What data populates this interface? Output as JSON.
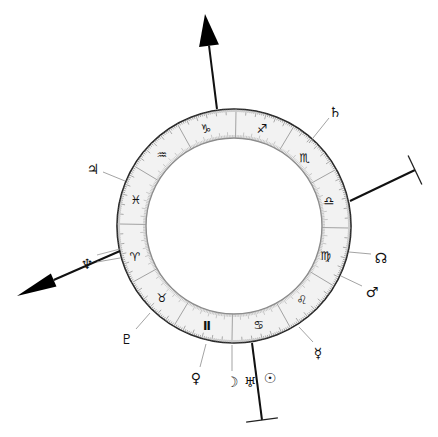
{
  "chart": {
    "center": [
      234,
      226
    ],
    "outer_radius": 117,
    "inner_radius": 88,
    "ring_color": "#f2f2f2",
    "line_color": "#222222",
    "tick_color": "#777777"
  },
  "signs": [
    {
      "name": "Aries",
      "glyph": "♈",
      "x": 135,
      "y": 257
    },
    {
      "name": "Taurus",
      "glyph": "♉",
      "x": 162,
      "y": 298
    },
    {
      "name": "Gemini",
      "glyph": "Ⅱ",
      "x": 207,
      "y": 326
    },
    {
      "name": "Cancer",
      "glyph": "♋",
      "x": 259,
      "y": 325
    },
    {
      "name": "Leo",
      "glyph": "♌",
      "x": 302,
      "y": 300
    },
    {
      "name": "Virgo",
      "glyph": "♍",
      "x": 326,
      "y": 256
    },
    {
      "name": "Libra",
      "glyph": "♎",
      "x": 329,
      "y": 201
    },
    {
      "name": "Scorpio",
      "glyph": "♏",
      "x": 305,
      "y": 158
    },
    {
      "name": "Sagittarius",
      "glyph": "♐",
      "x": 262,
      "y": 129
    },
    {
      "name": "Capricorn",
      "glyph": "♑",
      "x": 206,
      "y": 129
    },
    {
      "name": "Aquarius",
      "glyph": "♒",
      "x": 162,
      "y": 155
    },
    {
      "name": "Pisces",
      "glyph": "♓",
      "x": 136,
      "y": 200
    }
  ],
  "planets": [
    {
      "name": "Saturn",
      "glyph": "♄",
      "x": 335,
      "y": 112,
      "line": [
        [
          309,
          143
        ],
        [
          329,
          118
        ]
      ]
    },
    {
      "name": "Jupiter",
      "glyph": "♃",
      "x": 93,
      "y": 169,
      "line": [
        [
          103,
          172
        ],
        [
          125,
          181
        ]
      ]
    },
    {
      "name": "Neptune",
      "glyph": "♆",
      "x": 87,
      "y": 264,
      "line": [
        [
          97,
          262
        ],
        [
          120,
          258
        ]
      ]
    },
    {
      "name": "Pluto",
      "glyph": "♇",
      "x": 127,
      "y": 339,
      "line": [
        [
          136,
          329
        ],
        [
          150,
          313
        ]
      ]
    },
    {
      "name": "Venus",
      "glyph": "♀",
      "x": 196,
      "y": 378,
      "line": [
        [
          200,
          367
        ],
        [
          206,
          344
        ]
      ]
    },
    {
      "name": "Moon",
      "glyph": "☽",
      "x": 232,
      "y": 382,
      "line": [
        [
          232,
          371
        ],
        [
          232,
          345
        ]
      ]
    },
    {
      "name": "Uranus",
      "glyph": "♅",
      "x": 250,
      "y": 382,
      "line": null
    },
    {
      "name": "Sun",
      "glyph": "☉",
      "x": 270,
      "y": 378,
      "line": null
    },
    {
      "name": "Mercury",
      "glyph": "☿",
      "x": 318,
      "y": 353,
      "line": [
        [
          313,
          342
        ],
        [
          299,
          327
        ]
      ]
    },
    {
      "name": "Mars",
      "glyph": "♂",
      "x": 372,
      "y": 292,
      "line": [
        [
          362,
          286
        ],
        [
          341,
          276
        ]
      ]
    },
    {
      "name": "North Node",
      "glyph": "☊",
      "x": 381,
      "y": 258,
      "line": [
        [
          371,
          254
        ],
        [
          349,
          252
        ]
      ]
    }
  ],
  "axes": [
    {
      "name": "MC",
      "type": "arrow",
      "from": [
        217,
        109
      ],
      "to": [
        205,
        14
      ]
    },
    {
      "name": "ASC",
      "type": "arrow",
      "from": [
        120,
        251
      ],
      "to": [
        17,
        296
      ]
    },
    {
      "name": "DSC",
      "type": "bar",
      "from": [
        350,
        201
      ],
      "to": [
        415,
        170
      ]
    },
    {
      "name": "IC",
      "type": "bar",
      "from": [
        252,
        343
      ],
      "to": [
        262,
        420
      ]
    }
  ]
}
